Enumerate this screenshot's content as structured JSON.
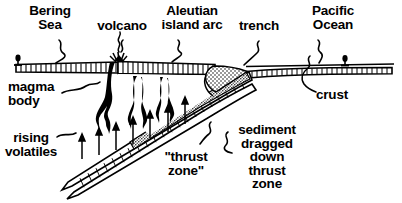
{
  "figure": {
    "type": "geologic-cross-section",
    "title_visible": false,
    "background_color": "#ffffff",
    "ink_color": "#000000",
    "width": 402,
    "height": 203
  },
  "labels": {
    "bering_sea": "Bering\nSea",
    "volcano": "volcano",
    "island_arc": "Aleutian\nisland arc",
    "trench": "trench",
    "pacific_ocean": "Pacific\nOcean",
    "crust": "crust",
    "magma_body": "magma\nbody",
    "rising_volatiles": "rising\nvolatiles",
    "thrust_zone": "\"thrust\nzone\"",
    "sediment": "sediment\ndragged\ndown\nthrust\nzone"
  },
  "features": [
    {
      "name": "bering-sea-label",
      "text": "Bering Sea",
      "role": "back-arc basin / marginal sea on the left (overriding plate side)"
    },
    {
      "name": "volcano",
      "text": "volcano",
      "role": "arc volcano emitting a smoke plume above the crust"
    },
    {
      "name": "aleutian-island-arc",
      "text": "Aleutian island arc",
      "role": "volcanic island arc built on the overriding plate"
    },
    {
      "name": "trench",
      "text": "trench",
      "role": "deep-sea trench where the oceanic plate bends downward"
    },
    {
      "name": "pacific-ocean",
      "text": "Pacific Ocean",
      "role": "oceanic plate side on the right"
    },
    {
      "name": "crust",
      "text": "crust",
      "role": "hatched horizontal band representing the crust layer"
    },
    {
      "name": "magma-body",
      "text": "magma body",
      "role": "three black teardrop-shaped magma bodies rising beneath the arc"
    },
    {
      "name": "rising-volatiles",
      "text": "rising volatiles",
      "role": "upward arrows showing volatiles released from the slab"
    },
    {
      "name": "thrust-zone",
      "text": "\"thrust zone\"",
      "role": "the hatched subducting slab descending to the lower left"
    },
    {
      "name": "sediment-dragged",
      "text": "sediment dragged down thrust zone",
      "role": "stippled sediment layer carried down along the thrust zone"
    }
  ],
  "symbols": {
    "sea_level_marker_left": "sea-level-marker",
    "sea_level_marker_right": "sea-level-marker",
    "leader_line_style": "squiggle",
    "arrow_direction_volatiles": "up",
    "arrow_direction_subduction": "down-left"
  },
  "colors": {
    "ink": "#000000",
    "paper": "#ffffff",
    "stipple": "#000000"
  }
}
